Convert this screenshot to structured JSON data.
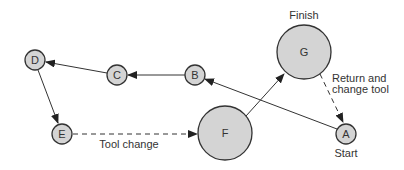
{
  "diagram": {
    "nodes": [
      {
        "id": "A",
        "label": "A",
        "cx": 346,
        "cy": 134,
        "r": 10
      },
      {
        "id": "B",
        "label": "B",
        "cx": 195,
        "cy": 75,
        "r": 10
      },
      {
        "id": "C",
        "label": "C",
        "cx": 117,
        "cy": 75,
        "r": 10
      },
      {
        "id": "D",
        "label": "D",
        "cx": 35,
        "cy": 60,
        "r": 10
      },
      {
        "id": "E",
        "label": "E",
        "cx": 62,
        "cy": 134,
        "r": 10
      },
      {
        "id": "F",
        "label": "F",
        "cx": 225,
        "cy": 133,
        "r": 27
      },
      {
        "id": "G",
        "label": "G",
        "cx": 304,
        "cy": 52,
        "r": 27
      }
    ],
    "edges": [
      {
        "from": "A",
        "to": "B",
        "style": "solid"
      },
      {
        "from": "B",
        "to": "C",
        "style": "solid"
      },
      {
        "from": "C",
        "to": "D",
        "style": "solid"
      },
      {
        "from": "D",
        "to": "E",
        "style": "solid"
      },
      {
        "from": "E",
        "to": "F",
        "style": "dashed",
        "label": "Tool change"
      },
      {
        "from": "F",
        "to": "G",
        "style": "solid"
      },
      {
        "from": "G",
        "to": "A",
        "style": "dashed",
        "label": "Return and change tool"
      }
    ],
    "annotations": {
      "finish": "Finish",
      "start": "Start",
      "tool_change": "Tool change",
      "return_line1": "Return and",
      "return_line2": "change tool"
    }
  }
}
